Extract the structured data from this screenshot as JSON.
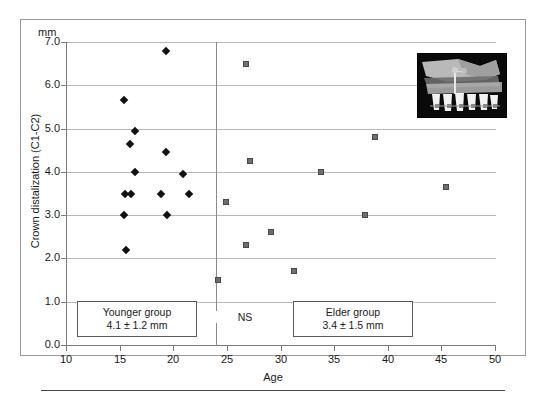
{
  "figure": {
    "unit_label": "mm",
    "x_axis_title": "Age",
    "y_axis_title": "Crown distalization (C1-C2)",
    "group_divider_age": 24,
    "inset_name": "lateral-cephalogram-tooth-movement-illustration"
  },
  "annotations": {
    "younger": {
      "title": "Younger group",
      "value": "4.1 ± 1.2 mm"
    },
    "elder": {
      "title": "Elder group",
      "value": "3.4 ± 1.5 mm"
    },
    "significance": "NS"
  },
  "colors": {
    "younger_marker": "#111111",
    "elder_marker": "#6e6e6e",
    "grid": "#b8b8b8",
    "axis": "#7a7a7a",
    "frame": "#9a9a9a"
  },
  "chart_data": {
    "type": "scatter",
    "title": "",
    "xlabel": "Age",
    "ylabel": "Crown distalization (C1-C2)",
    "yunit": "mm",
    "xlim": [
      10,
      50
    ],
    "ylim": [
      0.0,
      7.0
    ],
    "xticks": [
      10,
      15,
      20,
      25,
      30,
      35,
      40,
      45,
      50
    ],
    "yticks": [
      0.0,
      1.0,
      2.0,
      3.0,
      4.0,
      5.0,
      6.0,
      7.0
    ],
    "grid": "horizontal",
    "legend": "none",
    "series": [
      {
        "name": "Younger group",
        "marker": "diamond",
        "color": "#111111",
        "points": [
          {
            "x": 19.3,
            "y": 6.8
          },
          {
            "x": 15.4,
            "y": 5.65
          },
          {
            "x": 16.4,
            "y": 4.95
          },
          {
            "x": 16.0,
            "y": 4.65
          },
          {
            "x": 19.3,
            "y": 4.45
          },
          {
            "x": 16.4,
            "y": 4.0
          },
          {
            "x": 20.9,
            "y": 3.95
          },
          {
            "x": 15.5,
            "y": 3.5
          },
          {
            "x": 16.1,
            "y": 3.5
          },
          {
            "x": 18.9,
            "y": 3.5
          },
          {
            "x": 21.5,
            "y": 3.5
          },
          {
            "x": 15.4,
            "y": 3.0
          },
          {
            "x": 19.4,
            "y": 3.0
          },
          {
            "x": 15.6,
            "y": 2.2
          }
        ]
      },
      {
        "name": "Elder group",
        "marker": "square",
        "color": "#6e6e6e",
        "points": [
          {
            "x": 26.8,
            "y": 6.5
          },
          {
            "x": 38.8,
            "y": 4.8
          },
          {
            "x": 27.2,
            "y": 4.25
          },
          {
            "x": 33.8,
            "y": 4.0
          },
          {
            "x": 45.4,
            "y": 3.65
          },
          {
            "x": 24.9,
            "y": 3.3
          },
          {
            "x": 37.9,
            "y": 3.0
          },
          {
            "x": 29.1,
            "y": 2.6
          },
          {
            "x": 26.8,
            "y": 2.3
          },
          {
            "x": 31.3,
            "y": 1.7
          },
          {
            "x": 24.2,
            "y": 1.5
          }
        ]
      }
    ],
    "group_statistics": [
      {
        "group": "Younger group",
        "mean": 4.1,
        "sd": 1.2,
        "unit": "mm"
      },
      {
        "group": "Elder group",
        "mean": 3.4,
        "sd": 1.5,
        "unit": "mm"
      }
    ],
    "comparison": {
      "label": "NS",
      "meaning": "not significant"
    }
  }
}
